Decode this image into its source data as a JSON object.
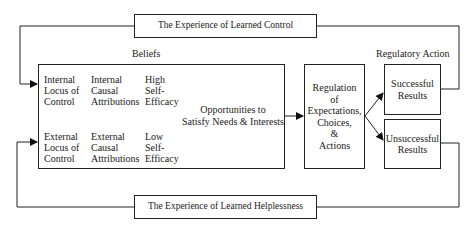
{
  "diagram": {
    "feedback_top": "The Experience of Learned Control",
    "feedback_bottom": "The Experience of Learned Helplessness",
    "beliefs_label": "Beliefs",
    "regulatory_label": "Regulatory Action",
    "beliefs": {
      "internal_locus": [
        "Internal",
        "Locus of",
        "Control"
      ],
      "internal_attrib": [
        "Internal",
        "Causal",
        "Attributions"
      ],
      "high_efficacy": [
        "High",
        "Self-",
        "Efficacy"
      ],
      "external_locus": [
        "External",
        "Locus of",
        "Control"
      ],
      "external_attrib": [
        "External",
        "Causal",
        "Attributions"
      ],
      "low_efficacy": [
        "Low",
        "Self-",
        "Efficacy"
      ],
      "opportunities": [
        "Opportunities to",
        "Satisfy Needs & Interests"
      ]
    },
    "regulation": [
      "Regulation",
      "of",
      "Expectations,",
      "Choices,",
      "&",
      "Actions"
    ],
    "successful": [
      "Successful",
      "Results"
    ],
    "unsuccessful": [
      "Unsuccessful",
      "Results"
    ]
  }
}
